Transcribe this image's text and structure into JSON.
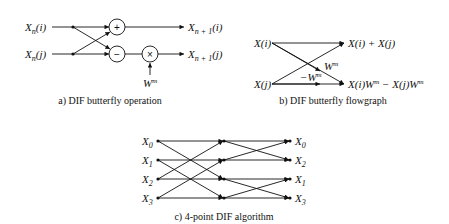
{
  "panel_a": {
    "caption": "a) DIF butterfly operation",
    "inputs": [
      "X",
      "X"
    ],
    "input_subs": [
      "n",
      "n"
    ],
    "input_args": [
      "(i)",
      "(j)"
    ],
    "outputs": [
      "X",
      "X"
    ],
    "output_subs": [
      "n + 1",
      "n + 1"
    ],
    "output_args": [
      "(i)",
      "(j)"
    ],
    "adder_symbol": "+",
    "subtractor_symbol": "−",
    "multiplier_symbol": "×",
    "twiddle": "W",
    "twiddle_exp": "m"
  },
  "panel_b": {
    "caption": "b) DIF butterfly flowgraph",
    "input_i": "X(i)",
    "input_j": "X(j)",
    "output_top": "X(i) + X(j)",
    "output_bottom": "X(i)W",
    "output_bottom_mid": " − X(j)W",
    "exp": "m",
    "weight_pos": "W",
    "weight_neg": "−W"
  },
  "panel_c": {
    "caption": "c) 4-point DIF algorithm",
    "inputs": [
      {
        "base": "X",
        "sub": "0"
      },
      {
        "base": "X",
        "sub": "1"
      },
      {
        "base": "X",
        "sub": "2"
      },
      {
        "base": "X",
        "sub": "3"
      }
    ],
    "outputs": [
      {
        "base": "X",
        "sub": "0"
      },
      {
        "base": "X",
        "sub": "2"
      },
      {
        "base": "X",
        "sub": "1"
      },
      {
        "base": "X",
        "sub": "3"
      }
    ]
  }
}
